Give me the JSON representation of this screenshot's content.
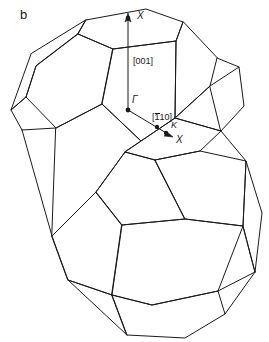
{
  "figure": {
    "panel_letter": "b",
    "caption_text": "",
    "background_color": "#ffffff",
    "line_color": "#1a1a1a",
    "width": 269,
    "height": 342
  },
  "labels": {
    "gamma": "Γ",
    "x_top": "X",
    "x_lower": "X",
    "k_point": "K",
    "dir_001": "[001]",
    "dir_110_prefix": "[",
    "dir_110_bar": "1",
    "dir_110_suffix": "10]"
  },
  "structure": {
    "name": "double-brillouin-zone",
    "description": "Two stacked truncated octahedron Brillouin zones",
    "zone_count": 2,
    "upper_zone": "truncated-octahedron-upper",
    "lower_zone": "truncated-octahedron-lower"
  },
  "symmetry_points": [
    {
      "name": "Γ",
      "role": "zone-center",
      "x": 128,
      "y": 110
    },
    {
      "name": "X",
      "role": "zone-face-center-top",
      "x": 130,
      "y": 17
    },
    {
      "name": "K",
      "role": "zone-edge-point",
      "x": 166,
      "y": 130
    },
    {
      "name": "X",
      "role": "zone-face-center-lower",
      "x": 172,
      "y": 136
    }
  ],
  "vectors": [
    {
      "label": "[001]",
      "from": "Γ",
      "to": "X",
      "orientation": "vertical-up"
    },
    {
      "label": "[̅1 10]",
      "from": "Γ",
      "to": "X",
      "orientation": "diagonal-down-right"
    }
  ]
}
